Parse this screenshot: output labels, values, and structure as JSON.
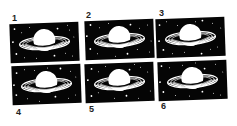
{
  "puzzle": {
    "description": "Six near-identical Saturn illustrations on starry black backgrounds, numbered 1-6",
    "colors": {
      "background": "#ffffff",
      "panel": "#050505",
      "planet": "#ffffff",
      "label": "#222222"
    },
    "panels": [
      {
        "number": "1",
        "label_x": 12,
        "label_y": 14,
        "x": 10,
        "y": 23,
        "tilt": -2
      },
      {
        "number": "2",
        "label_x": 86,
        "label_y": 11,
        "x": 85,
        "y": 20,
        "tilt": -2
      },
      {
        "number": "3",
        "label_x": 159,
        "label_y": 9,
        "x": 156,
        "y": 18,
        "tilt": -2
      },
      {
        "number": "4",
        "label_x": 16,
        "label_y": 108,
        "x": 12,
        "y": 65,
        "tilt": -2
      },
      {
        "number": "5",
        "label_x": 89,
        "label_y": 105,
        "x": 85,
        "y": 63,
        "tilt": -2
      },
      {
        "number": "6",
        "label_x": 161,
        "label_y": 102,
        "x": 158,
        "y": 61,
        "tilt": -2
      }
    ]
  }
}
